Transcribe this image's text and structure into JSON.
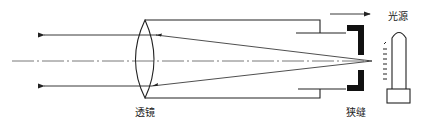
{
  "diagram": {
    "type": "optical-collimator",
    "labels": {
      "lens": "透镜",
      "slit": "狭缝",
      "light_source": "光源"
    },
    "colors": {
      "stroke": "#222222",
      "background": "#ffffff",
      "fill_dark": "#111111"
    }
  }
}
